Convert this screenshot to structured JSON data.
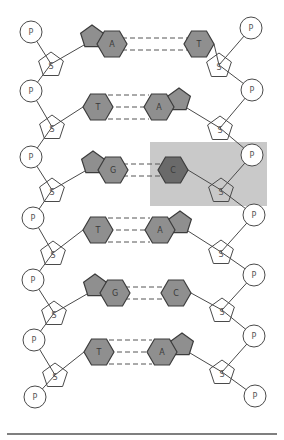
{
  "diagram": {
    "colors": {
      "background": "#ffffff",
      "stroke": "#4a4a4a",
      "base_fill": "#8f8f8f",
      "highlight_base_fill": "#6a6a6a",
      "highlight_box": "#c9c9c9",
      "rule": "#555555"
    },
    "labels": {
      "phosphate": "P",
      "sugar": "S"
    },
    "left_strand": {
      "phosphates": [
        {
          "x": 31,
          "y": 32
        },
        {
          "x": 31,
          "y": 91
        },
        {
          "x": 31,
          "y": 157
        },
        {
          "x": 33,
          "y": 218
        },
        {
          "x": 33,
          "y": 280
        },
        {
          "x": 34,
          "y": 340
        },
        {
          "x": 35,
          "y": 397
        }
      ],
      "sugars": [
        {
          "x": 51,
          "y": 64
        },
        {
          "x": 52,
          "y": 127
        },
        {
          "x": 52,
          "y": 190
        },
        {
          "x": 53,
          "y": 253
        },
        {
          "x": 54,
          "y": 313
        },
        {
          "x": 55,
          "y": 375
        }
      ]
    },
    "right_strand": {
      "phosphates": [
        {
          "x": 251,
          "y": 28
        },
        {
          "x": 252,
          "y": 90
        },
        {
          "x": 252,
          "y": 155
        },
        {
          "x": 254,
          "y": 215
        },
        {
          "x": 254,
          "y": 275
        },
        {
          "x": 254,
          "y": 336
        },
        {
          "x": 255,
          "y": 396
        }
      ],
      "sugars": [
        {
          "x": 219,
          "y": 65
        },
        {
          "x": 220,
          "y": 128
        },
        {
          "x": 221,
          "y": 190
        },
        {
          "x": 221,
          "y": 252
        },
        {
          "x": 222,
          "y": 310
        },
        {
          "x": 222,
          "y": 372
        }
      ]
    },
    "base_pairs": [
      {
        "left": "A",
        "right": "T",
        "hbonds": 2,
        "y": 44,
        "left_x": 112,
        "right_x": 199,
        "left_type": "purine",
        "right_type": "pyrimidine",
        "highlight": false
      },
      {
        "left": "T",
        "right": "A",
        "hbonds": 3,
        "y": 107,
        "left_x": 98,
        "right_x": 159,
        "left_type": "pyrimidine",
        "right_type": "purine",
        "highlight": false
      },
      {
        "left": "G",
        "right": "C",
        "hbonds": 2,
        "y": 170,
        "left_x": 113,
        "right_x": 173,
        "left_type": "purine",
        "right_type": "pyrimidine",
        "highlight": true
      },
      {
        "left": "T",
        "right": "A",
        "hbonds": 3,
        "y": 230,
        "left_x": 98,
        "right_x": 160,
        "left_type": "pyrimidine",
        "right_type": "purine",
        "highlight": false
      },
      {
        "left": "G",
        "right": "C",
        "hbonds": 2,
        "y": 293,
        "left_x": 115,
        "right_x": 176,
        "left_type": "purine",
        "right_type": "pyrimidine",
        "highlight": false
      },
      {
        "left": "T",
        "right": "A",
        "hbonds": 3,
        "y": 352,
        "left_x": 99,
        "right_x": 162,
        "left_type": "pyrimidine",
        "right_type": "purine",
        "highlight": false
      }
    ],
    "highlight_box": {
      "x": 150,
      "y": 142,
      "width": 117,
      "height": 64
    },
    "bottom_rule": {
      "x1": 7,
      "x2": 277,
      "y": 434
    }
  }
}
